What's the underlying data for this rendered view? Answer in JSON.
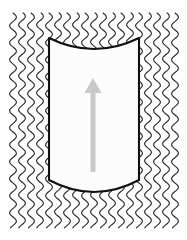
{
  "figure": {
    "canvas": {
      "width": 187,
      "height": 240,
      "background_color": "#ffffff"
    },
    "background_field": {
      "name": "wavy-hatch-field",
      "description": "Field of vertical sinusoidal lines filling the background region",
      "stroke_color": "#2b2b2b",
      "stroke_width": 1.15,
      "line_count": 19,
      "column_spacing_px": 9,
      "wave_amplitude_px": 3.4,
      "wave_period_px": 17,
      "field_left_px": 13,
      "field_right_px": 175,
      "field_top_px": 13,
      "field_bottom_px": 228
    },
    "body": {
      "name": "cylinder-body",
      "description": "Vertical cylinder outline with concave top arc and convex bottom arc",
      "fill_color": "#fcfcfc",
      "stroke_color": "#111111",
      "stroke_width": 2.1,
      "left_px": 49,
      "right_px": 139,
      "top_corner_y_px": 38,
      "top_arc_center_y_px": 49,
      "bottom_corner_y_px": 180,
      "bottom_arc_center_y_px": 192,
      "top_edge_shape": "concave-arc",
      "bottom_edge_shape": "convex-arc",
      "side_edge_shape": "straight-vertical"
    },
    "arrow": {
      "name": "direction-arrow",
      "description": "Light gray arrow indicating upward direction of motion",
      "color": "#c9c9c9",
      "direction": "up",
      "tip_y_px": 78,
      "tail_y_px": 172,
      "center_x_px": 93,
      "head_width_px": 17,
      "head_height_px": 15,
      "shaft_width_px": 5
    }
  }
}
